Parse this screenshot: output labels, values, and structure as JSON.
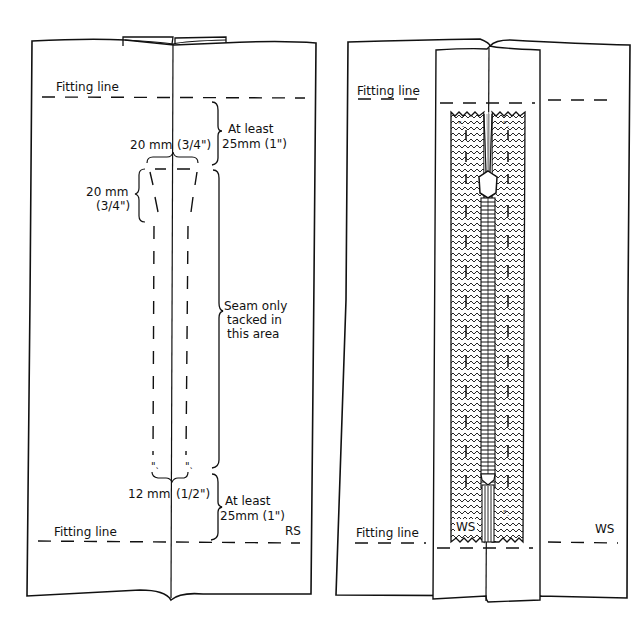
{
  "left_panel": {
    "name": "Right side view (seam tacked)",
    "fitting_line_top": "Fitting line",
    "fitting_line_bottom": "Fitting line",
    "top_gap_label_1": "At least",
    "top_gap_label_2": "25mm (1\")",
    "width_top_mm": "20 mm",
    "width_top_in": "(3/4\")",
    "taper_mm": "20 mm",
    "taper_in": "(3/4\")",
    "seam_label_1": "Seam only",
    "seam_label_2": "tacked in",
    "seam_label_3": "this area",
    "width_bottom_mm": "12 mm",
    "width_bottom_in": "(1/2\")",
    "bottom_gap_label_1": "At least",
    "bottom_gap_label_2": "25mm (1\")",
    "side_label": "RS"
  },
  "right_panel": {
    "name": "Wrong side view (zip placed)",
    "fitting_line_top": "Fitting line",
    "fitting_line_bottom": "Fitting line",
    "zip_tape_label": "WS",
    "side_label": "WS"
  },
  "colors": {
    "ink": "#111111",
    "paper": "#ffffff"
  }
}
